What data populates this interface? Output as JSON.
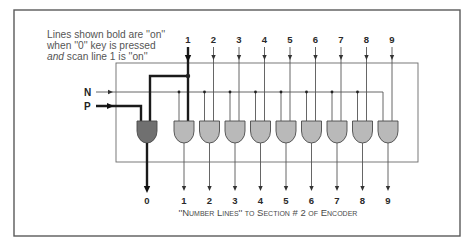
{
  "annotation": {
    "line1": "Lines shown bold are ''on''",
    "line2": "when ''0'' key is pressed",
    "line3_italic": "and",
    "line3_rest": " scan line 1 is ''on''"
  },
  "inputs": {
    "n_label": "N",
    "p_label": "P"
  },
  "scan_lines": [
    "1",
    "2",
    "3",
    "4",
    "5",
    "6",
    "7",
    "8",
    "9"
  ],
  "number_lines": [
    "0",
    "1",
    "2",
    "3",
    "4",
    "5",
    "6",
    "7",
    "8",
    "9"
  ],
  "active": {
    "key": "0",
    "scan_line": "1",
    "gate": "0"
  },
  "caption": "''Number Lines'' to Section # 2 of Encoder",
  "colors": {
    "gate_on": "#707070",
    "gate_off": "#b9b9b9",
    "bold_line": "#1a1a1a",
    "thin_line": "#555555",
    "frame": "#5a5a5a"
  }
}
